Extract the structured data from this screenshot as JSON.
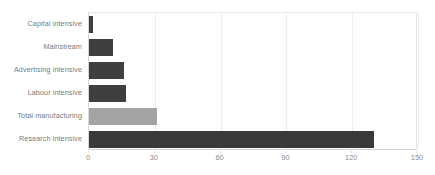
{
  "chart_data": {
    "type": "bar",
    "orientation": "horizontal",
    "title": "",
    "subtitle": "",
    "xlabel": "",
    "ylabel": "",
    "categories": [
      "Capital intensive",
      "Mainstream",
      "Advertising intensive",
      "Labour intensive",
      "Total manufacturing",
      "Research intensive"
    ],
    "values": [
      2,
      11,
      16,
      17,
      31,
      130
    ],
    "bar_colors": [
      "#3f3f3f",
      "#3f3f3f",
      "#3f3f3f",
      "#3f3f3f",
      "#a3a3a3",
      "#3a3a3a"
    ],
    "xlim": [
      0,
      150
    ],
    "xticks": [
      0,
      30,
      60,
      90,
      120,
      150
    ],
    "xtick_labels": [
      "0",
      "30",
      "60",
      "90",
      "120",
      "150"
    ],
    "grid": true,
    "grid_axis": "x",
    "legend": false,
    "legend_position": "none",
    "highlight_category": "Total manufacturing"
  },
  "style": {
    "background": "#ffffff",
    "grid_color": "#ececec",
    "axis_color": "#d9d9d9",
    "label_color": "#7a7a7a",
    "tick_color": "#8a8a8a",
    "bar_dark": "#3f3f3f",
    "bar_light": "#a3a3a3"
  }
}
